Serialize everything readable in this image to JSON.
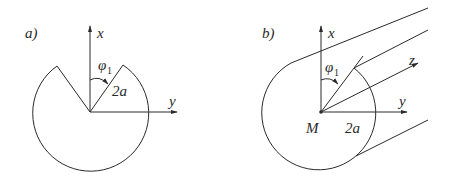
{
  "panels": [
    {
      "id": "a",
      "label": "a)",
      "axis_x": "x",
      "axis_y": "y",
      "angle_symbol": "φ",
      "angle_subscript": "1",
      "radius_label": "2a"
    },
    {
      "id": "b",
      "label": "b)",
      "axis_x": "x",
      "axis_y": "y",
      "axis_z": "z",
      "angle_symbol": "φ",
      "angle_subscript": "1",
      "radius_label": "2a",
      "origin_label": "M"
    }
  ],
  "colors": {
    "stroke": "#2a2a2a",
    "background": "#ffffff"
  }
}
